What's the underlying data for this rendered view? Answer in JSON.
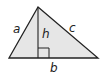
{
  "diagram": {
    "type": "triangle",
    "fill": "#e6e6e6",
    "stroke": "#222222",
    "vertices": {
      "apex": [
        38,
        7
      ],
      "left": [
        9,
        58
      ],
      "right": [
        98,
        58
      ]
    },
    "labels": {
      "a": "a",
      "b": "b",
      "c": "c",
      "h": "h"
    },
    "right_angle_marker": true
  }
}
